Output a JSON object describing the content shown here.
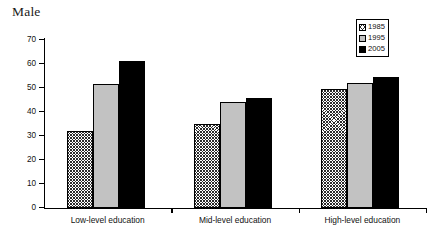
{
  "chart_data": {
    "type": "bar",
    "title": "Male",
    "xlabel": "",
    "ylabel": "",
    "ylim": [
      0,
      70
    ],
    "yticks": [
      0,
      10,
      20,
      30,
      40,
      50,
      60,
      70
    ],
    "grid": false,
    "legend_position": "upper-right",
    "categories": [
      "Low-level education",
      "Mid-level education",
      "High-level education"
    ],
    "series": [
      {
        "name": "1985",
        "values": [
          32,
          35,
          49.5
        ],
        "fill": "hatch",
        "color": "#ffffff"
      },
      {
        "name": "1995",
        "values": [
          51.5,
          44,
          52
        ],
        "fill": "solid",
        "color": "#c2c2c2"
      },
      {
        "name": "2005",
        "values": [
          61,
          45.5,
          54.5
        ],
        "fill": "solid",
        "color": "#000000"
      }
    ]
  },
  "legend": {
    "items": [
      {
        "label": "1985"
      },
      {
        "label": "1995"
      },
      {
        "label": "2005"
      }
    ]
  },
  "axis": {
    "y_tick_labels": [
      "70",
      "60",
      "50",
      "40",
      "30",
      "20",
      "10",
      "0"
    ]
  }
}
